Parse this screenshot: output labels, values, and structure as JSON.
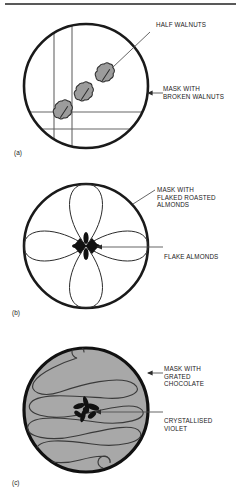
{
  "figure": {
    "title_rule": true,
    "panels": [
      {
        "id": "a",
        "letter": "(a)",
        "description": "Circle template with grid lines and three half walnut shapes",
        "annotations": [
          {
            "name": "half-walnuts",
            "text": "HALF WALNUTS"
          },
          {
            "name": "mask-with-broken-walnuts",
            "text": "MASK WITH\nBROKEN WALNUTS"
          }
        ]
      },
      {
        "id": "b",
        "letter": "(b)",
        "description": "Circle with four petal flower mask and flake almond centre",
        "annotations": [
          {
            "name": "mask-with-flaked-roasted-almonds",
            "text": "MASK WITH\nFLAKED ROASTED\nALMONDS"
          },
          {
            "name": "flake-almonds",
            "text": "FLAKE ALMONDS"
          }
        ]
      },
      {
        "id": "c",
        "letter": "(c)",
        "description": "Grey filled circle with serpentine piping and crystallised violet centre",
        "annotations": [
          {
            "name": "mask-with-grated-chocolate",
            "text": "MASK WITH\nGRATED\nCHOCOLATE"
          },
          {
            "name": "crystallised-violet",
            "text": "CRYSTALLISED\nVIOLET"
          }
        ]
      }
    ]
  },
  "colors": {
    "ink": "#1a1a1a",
    "rule": "#595959",
    "grey_fill": "#a8a8a8",
    "walnut_fill": "#9c9c9c",
    "line": "#4a4a4a",
    "background": "#ffffff"
  }
}
